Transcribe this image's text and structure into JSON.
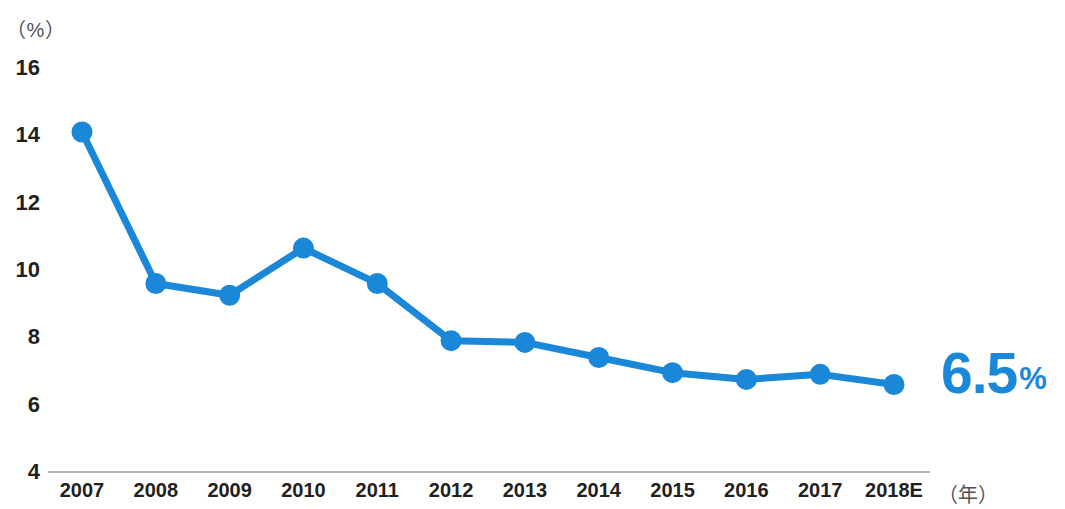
{
  "chart_data": {
    "type": "line",
    "title": "",
    "subtitle": "",
    "xlabel": "（年）",
    "ylabel": "（%）",
    "categories": [
      "2007",
      "2008",
      "2009",
      "2010",
      "2011",
      "2012",
      "2013",
      "2014",
      "2015",
      "2016",
      "2017",
      "2018E"
    ],
    "values": [
      14.1,
      9.6,
      9.25,
      10.65,
      9.6,
      7.9,
      7.85,
      7.4,
      6.95,
      6.75,
      6.9,
      6.6
    ],
    "series": [
      {
        "name": "",
        "values": [
          14.1,
          9.6,
          9.25,
          10.65,
          9.6,
          7.9,
          7.85,
          7.4,
          6.95,
          6.75,
          6.9,
          6.6
        ]
      }
    ],
    "ylim": [
      4,
      16
    ],
    "y_ticks": [
      "16",
      "14",
      "12",
      "10",
      "8",
      "6",
      "4"
    ],
    "y_tick_values": [
      16,
      14,
      12,
      10,
      8,
      6,
      4
    ],
    "grid": false,
    "legend": null,
    "annotations": [
      {
        "name": "final-value-callout",
        "value": "6.5",
        "unit": "%",
        "color": "#1b87d8"
      }
    ],
    "colors": {
      "line": "#1b87d8",
      "marker": "#1b87d8",
      "axis": "#9b9b9b",
      "text": "#231f20",
      "muted_text": "#555355"
    }
  },
  "axis": {
    "unit_label": "（%）",
    "x_caption": "（年）"
  },
  "callout": {
    "value": "6.5",
    "unit": "%"
  }
}
